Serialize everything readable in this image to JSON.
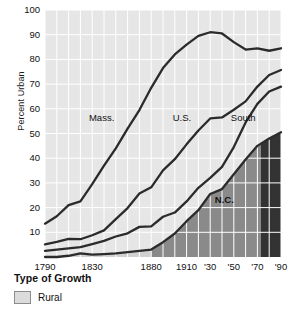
{
  "chart_data": {
    "type": "line",
    "title": "",
    "xlabel": "",
    "ylabel": "Percent Urban",
    "ylim": [
      0,
      100
    ],
    "xlim": [
      1790,
      1990
    ],
    "grid": true,
    "legend_position": "below-plot",
    "y_ticks": [
      100,
      90,
      80,
      70,
      60,
      50,
      40,
      30,
      20,
      10
    ],
    "x_ticks": [
      {
        "value": 1790,
        "label": "1790"
      },
      {
        "value": 1830,
        "label": "1830"
      },
      {
        "value": 1880,
        "label": "1880"
      },
      {
        "value": 1910,
        "label": "1910"
      },
      {
        "value": 1930,
        "label": "'30"
      },
      {
        "value": 1950,
        "label": "'50"
      },
      {
        "value": 1970,
        "label": "'70"
      },
      {
        "value": 1990,
        "label": "'90"
      }
    ],
    "annotations": [
      {
        "text": "Mass.",
        "x": 1838,
        "y": 55
      },
      {
        "text": "U.S.",
        "x": 1906,
        "y": 55
      },
      {
        "text": "South",
        "x": 1958,
        "y": 55
      },
      {
        "text": "N.C.",
        "x": 1942,
        "y": 22
      }
    ],
    "series": [
      {
        "name": "Mass.",
        "x": [
          1790,
          1800,
          1810,
          1820,
          1830,
          1840,
          1850,
          1860,
          1870,
          1880,
          1890,
          1900,
          1910,
          1920,
          1930,
          1940,
          1950,
          1960,
          1970,
          1980,
          1990
        ],
        "values": [
          13.5,
          16.5,
          21.0,
          22.5,
          29.5,
          37.0,
          44.0,
          52.0,
          59.5,
          68.5,
          76.5,
          82.0,
          86.0,
          89.5,
          91.0,
          90.5,
          87.0,
          84.0,
          84.5,
          83.5,
          84.5
        ]
      },
      {
        "name": "U.S.",
        "x": [
          1790,
          1800,
          1810,
          1820,
          1830,
          1840,
          1850,
          1860,
          1870,
          1880,
          1890,
          1900,
          1910,
          1920,
          1930,
          1940,
          1950,
          1960,
          1970,
          1980,
          1990
        ],
        "values": [
          5.1,
          6.1,
          7.3,
          7.2,
          8.8,
          10.8,
          15.3,
          19.8,
          25.7,
          28.2,
          35.1,
          39.6,
          45.6,
          51.2,
          56.1,
          56.5,
          59.6,
          63.0,
          69.0,
          73.7,
          75.7
        ]
      },
      {
        "name": "South",
        "x": [
          1790,
          1800,
          1810,
          1820,
          1830,
          1840,
          1850,
          1860,
          1870,
          1880,
          1890,
          1900,
          1910,
          1920,
          1930,
          1940,
          1950,
          1960,
          1970,
          1980,
          1990
        ],
        "values": [
          2.5,
          3.0,
          3.5,
          4.0,
          5.2,
          6.5,
          8.3,
          9.6,
          12.2,
          12.4,
          16.3,
          18.0,
          22.5,
          28.0,
          32.0,
          36.5,
          44.5,
          54.5,
          62.0,
          67.0,
          69.0
        ]
      },
      {
        "name": "N.C.",
        "x": [
          1790,
          1800,
          1810,
          1820,
          1830,
          1840,
          1850,
          1860,
          1870,
          1880,
          1890,
          1900,
          1910,
          1920,
          1930,
          1940,
          1950,
          1960,
          1970,
          1980,
          1990
        ],
        "values": [
          0.0,
          0.0,
          0.5,
          1.5,
          1.0,
          1.2,
          1.5,
          2.0,
          2.5,
          3.0,
          6.0,
          9.5,
          14.5,
          19.0,
          25.5,
          27.5,
          33.5,
          39.5,
          45.0,
          48.0,
          50.5
        ]
      }
    ]
  },
  "figure": {
    "top_fragment": "",
    "y_axis_title": "Percent Urban"
  },
  "legend": {
    "title": "Type of Growth",
    "items": [
      {
        "label": "Rural",
        "color": "#dcdcdc"
      }
    ]
  },
  "colors": {
    "plot_background": "#e6e6e6",
    "grid": "#ffffff",
    "line": "#2b2b2b",
    "rural_band": "#d0d0d0",
    "mid_fill": "#8a8a8a",
    "dark_fill": "#333333",
    "text": "#111111"
  }
}
